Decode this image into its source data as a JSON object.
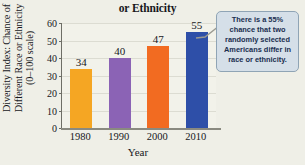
{
  "chart_data": {
    "type": "bar",
    "title": "Americans Are a Different Race or Ethnicity",
    "title_lines": [
      "Americans Are a Different Race",
      "or Ethnicity"
    ],
    "xlabel": "Year",
    "ylabel": "Diversity Index: Chance of Different Race or Ethnicity (0–100 scale)",
    "ylabel_lines": [
      "Diversity Index: Chance of",
      "Different Race or Ethnicity",
      "(0–100 scale)"
    ],
    "categories": [
      "1980",
      "1990",
      "2000",
      "2010"
    ],
    "values": [
      34,
      40,
      47,
      55
    ],
    "value_labels": [
      "34",
      "40",
      "47",
      "55"
    ],
    "ylim": [
      0,
      60
    ],
    "yticks": [
      0,
      10,
      20,
      30,
      40,
      50,
      60
    ],
    "ytick_labels": [
      "0",
      "10",
      "20",
      "30",
      "40",
      "50",
      "60"
    ],
    "grid": true,
    "legend": false,
    "bar_colors": [
      "#f5a623",
      "#8b63b5",
      "#f26b21",
      "#2e4fa8"
    ]
  },
  "annotation": {
    "text": "There is a 55% chance that two randomly selected Americans differ in race or ethnicity.",
    "lines": [
      "There is a 55%",
      "chance that two",
      "randomly selected",
      "Americans differ in",
      "race or ethnicity."
    ],
    "fill_color": "#d5dfe8",
    "border_color": "#8fa4b5",
    "text_color": "#1a2e4f",
    "leader_color": "#9a9a92"
  },
  "colors": {
    "background": "#efefe7",
    "plot_background": "#f2f2ea",
    "axis": "#6e6e66",
    "baseline": "#8a8a80",
    "gridline": "#dcdcd2",
    "text": "#17171c"
  }
}
